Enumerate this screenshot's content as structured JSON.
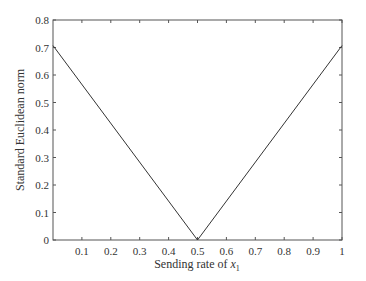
{
  "chart_data": {
    "type": "line",
    "title": "",
    "xlabel": "Sending rate of x1",
    "xlabel_parts": {
      "prefix": "Sending rate of ",
      "var": "x",
      "sub": "1"
    },
    "ylabel": "Standard Euclidean norm",
    "xlim": [
      0,
      1
    ],
    "ylim": [
      0,
      0.8
    ],
    "xticks": [
      0.1,
      0.2,
      0.3,
      0.4,
      0.5,
      0.6,
      0.7,
      0.8,
      0.9,
      1
    ],
    "xtick_labels": [
      "0.1",
      "0.2",
      "0.3",
      "0.4",
      "0.5",
      "0.6",
      "0.7",
      "0.8",
      "0.9",
      "1"
    ],
    "yticks": [
      0,
      0.1,
      0.2,
      0.3,
      0.4,
      0.5,
      0.6,
      0.7,
      0.8
    ],
    "ytick_labels": [
      "0",
      "0.1",
      "0.2",
      "0.3",
      "0.4",
      "0.5",
      "0.6",
      "0.7",
      "0.8"
    ],
    "grid": false,
    "legend": null,
    "series": [
      {
        "name": "norm",
        "x": [
          0,
          0.5,
          1
        ],
        "y": [
          0.707,
          0,
          0.707
        ],
        "color": "#333333"
      }
    ]
  }
}
